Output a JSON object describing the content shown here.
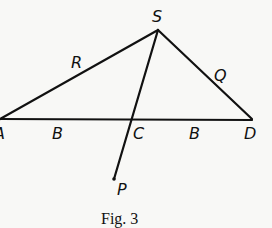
{
  "figure": {
    "caption": "Fig. 3",
    "points": {
      "S": {
        "label": "S",
        "x": 158,
        "y": 30
      },
      "A": {
        "label": "A",
        "x": 0,
        "y": 119
      },
      "D": {
        "label": "D",
        "x": 252,
        "y": 119
      },
      "C": {
        "label": "C",
        "x": 132,
        "y": 119
      },
      "P": {
        "label": "P",
        "x": 114,
        "y": 179
      }
    },
    "segment_labels": {
      "SA": "R",
      "SD": "Q",
      "AC": "B",
      "CD": "B"
    },
    "lines": [
      {
        "from": "A",
        "to": "S"
      },
      {
        "from": "S",
        "to": "D"
      },
      {
        "from": "A",
        "to": "D"
      },
      {
        "from": "S",
        "to": "P"
      }
    ],
    "colors": {
      "ink": "#111111",
      "paper": "#f8f8f6"
    }
  }
}
